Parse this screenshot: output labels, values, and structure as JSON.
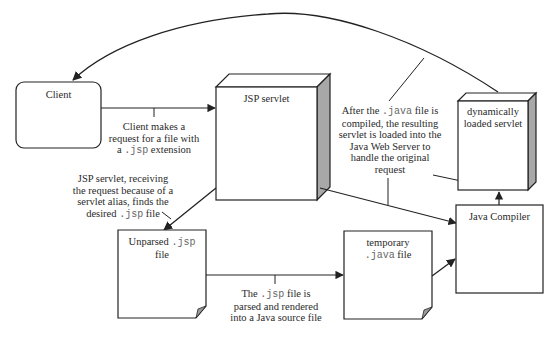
{
  "diagram": {
    "nodes": {
      "client": {
        "label": "Client",
        "shape": "rounded-rectangle"
      },
      "jsp_servlet": {
        "label": "JSP servlet",
        "shape": "3d-box"
      },
      "dynamic_servlet": {
        "line1": "dynamically",
        "line2": "loaded servlet",
        "shape": "3d-box"
      },
      "java_compiler": {
        "label": "Java Compiler",
        "shape": "rectangle"
      },
      "unparsed_jsp": {
        "prefix": "Unparsed ",
        "code": ".jsp",
        "line2": "file",
        "shape": "document"
      },
      "temp_java": {
        "line1": "temporary",
        "code": ".java",
        "suffix": " file",
        "shape": "document"
      }
    },
    "annotations": {
      "client_request": {
        "line1": "Client makes a",
        "line2": "request for a file with",
        "line3_prefix": "a ",
        "line3_code": ".jsp",
        "line3_suffix": " extension"
      },
      "servlet_finds": {
        "line1": "JSP servlet, receiving",
        "line2": "the request because of a",
        "line3": "servlet alias, finds the",
        "line4_prefix": "desired ",
        "line4_code": ".jsp",
        "line4_suffix": " file"
      },
      "parse_render": {
        "line1_prefix": "The ",
        "line1_code": ".jsp",
        "line1_suffix": " file is",
        "line2": "parsed and rendered",
        "line3": "into a Java source file"
      },
      "compiled_loaded": {
        "line1_prefix": "After the ",
        "line1_code": ".java",
        "line1_suffix": " file is",
        "line2": "compiled, the resulting",
        "line3": "servlet is loaded into the",
        "line4": "Java Web Server to",
        "line5": "handle the original",
        "line6": "request"
      }
    },
    "edges": [
      {
        "from": "client",
        "to": "jsp_servlet"
      },
      {
        "from": "jsp_servlet",
        "to": "unparsed_jsp"
      },
      {
        "from": "jsp_servlet",
        "to": "java_compiler"
      },
      {
        "from": "unparsed_jsp",
        "to": "temp_java"
      },
      {
        "from": "temp_java",
        "to": "java_compiler"
      },
      {
        "from": "java_compiler",
        "to": "dynamic_servlet"
      },
      {
        "from": "dynamic_servlet",
        "to": "client"
      }
    ],
    "colors": {
      "stroke": "#222222",
      "side_shade": "#a8a8a8",
      "top_face": "#ffffff",
      "fold": "#9a9a9a"
    }
  }
}
